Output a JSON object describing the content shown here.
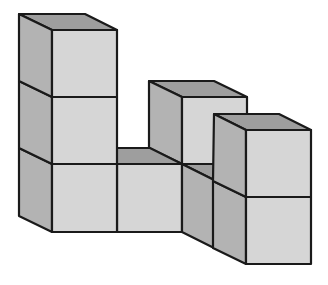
{
  "figure": {
    "cube_count": 8,
    "colors": {
      "front_face": "#d6d6d6",
      "side_face": "#b3b3b3",
      "top_face": "#9e9e9e",
      "edge": "#1a1a1a",
      "background": "#ffffff"
    }
  }
}
